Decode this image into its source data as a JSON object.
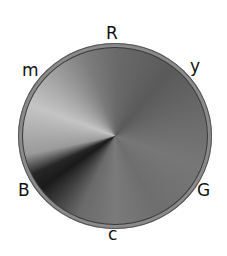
{
  "diagram": {
    "type": "color-wheel",
    "rendering": "grayscale",
    "labels": {
      "top": "R",
      "upper_right": "y",
      "lower_right": "G",
      "bottom": "c",
      "lower_left": "B",
      "upper_left": "m"
    }
  }
}
